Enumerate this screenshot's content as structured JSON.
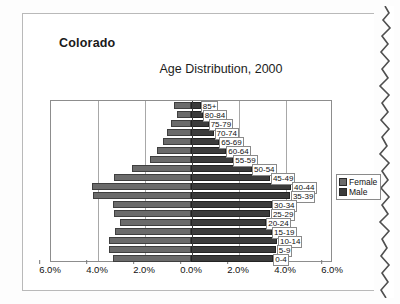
{
  "sheet": {
    "state_title": "Colorado",
    "chart_title": "Age Distribution, 2000"
  },
  "legend": {
    "items": [
      {
        "label": "Female",
        "color": "#6b6b6b"
      },
      {
        "label": "Male",
        "color": "#3b3b3b"
      }
    ]
  },
  "axis": {
    "ticks": [
      "6.0%",
      "4.0%",
      "2.0%",
      "0.0%",
      "2.0%",
      "4.0%",
      "6.0%"
    ]
  },
  "chart_data": {
    "type": "bar",
    "subtype": "population-pyramid",
    "title": "Age Distribution, 2000",
    "xlabel": "",
    "ylabel": "",
    "xlim": [
      -6.0,
      6.0
    ],
    "xunit": "%",
    "grid": true,
    "legend_position": "right",
    "categories": [
      "85+",
      "80-84",
      "75-79",
      "70-74",
      "65-69",
      "60-64",
      "55-59",
      "50-54",
      "45-49",
      "40-44",
      "35-39",
      "30-34",
      "25-29",
      "20-24",
      "15-19",
      "10-14",
      "5-9",
      "0-4"
    ],
    "series": [
      {
        "name": "Female",
        "side": "left",
        "color": "#6b6b6b",
        "values": [
          0.75,
          0.62,
          0.85,
          1.05,
          1.2,
          1.45,
          1.75,
          2.55,
          3.3,
          4.25,
          4.2,
          3.35,
          3.3,
          3.05,
          3.25,
          3.5,
          3.5,
          3.35
        ]
      },
      {
        "name": "Male",
        "side": "right",
        "color": "#3b3b3b",
        "values": [
          0.42,
          0.5,
          0.75,
          1.0,
          1.2,
          1.5,
          1.8,
          2.6,
          3.4,
          4.3,
          4.25,
          3.45,
          3.4,
          3.2,
          3.45,
          3.7,
          3.65,
          3.5
        ]
      }
    ]
  }
}
